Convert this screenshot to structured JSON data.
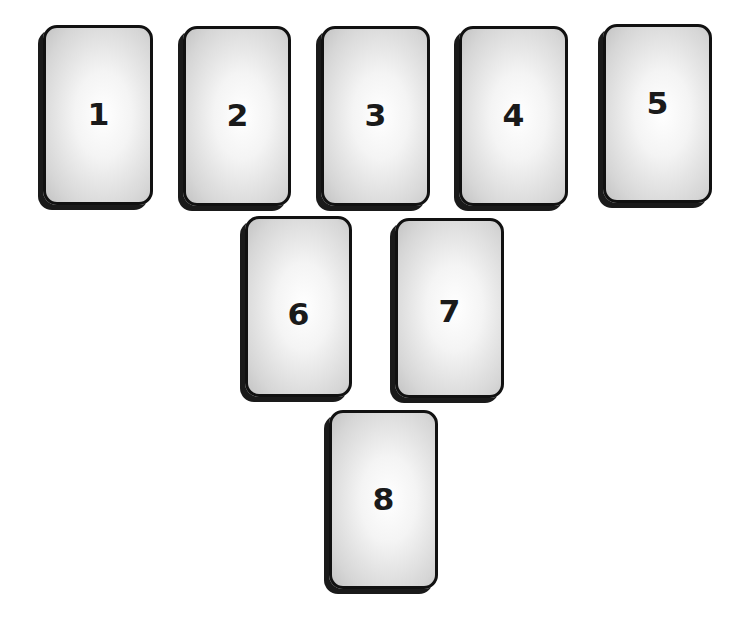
{
  "layout": {
    "title": "",
    "rows": [
      [
        "1",
        "2",
        "3",
        "4",
        "5"
      ],
      [
        "6",
        "7"
      ],
      [
        "8"
      ]
    ]
  },
  "cards": [
    {
      "position": "1",
      "label": "1",
      "x": 43,
      "y": 25,
      "w": 110,
      "h": 180
    },
    {
      "position": "2",
      "label": "2",
      "x": 183,
      "y": 26,
      "w": 108,
      "h": 180
    },
    {
      "position": "3",
      "label": "3",
      "x": 321,
      "y": 26,
      "w": 109,
      "h": 180
    },
    {
      "position": "4",
      "label": "4",
      "x": 459,
      "y": 26,
      "w": 109,
      "h": 180
    },
    {
      "position": "5",
      "label": "5",
      "x": 603,
      "y": 24,
      "w": 109,
      "h": 179
    },
    {
      "position": "6",
      "label": "6",
      "x": 245,
      "y": 216,
      "w": 107,
      "h": 181
    },
    {
      "position": "7",
      "label": "7",
      "x": 395,
      "y": 218,
      "w": 109,
      "h": 180
    },
    {
      "position": "8",
      "label": "8",
      "x": 329,
      "y": 410,
      "w": 109,
      "h": 179
    }
  ],
  "colors": {
    "card_border": "#111111",
    "card_fill_center": "#ffffff",
    "card_fill_edge": "#c4c4c4",
    "number": "#1a1a1a",
    "background": "#ffffff"
  }
}
